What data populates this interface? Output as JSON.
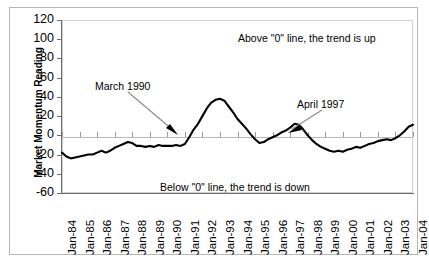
{
  "chart_data": {
    "type": "line",
    "title": "",
    "xlabel": "",
    "ylabel": "Market Momentum Reading",
    "ylim": [
      -60,
      120
    ],
    "yticks": [
      120,
      100,
      80,
      60,
      40,
      20,
      0,
      -20,
      -40,
      -60
    ],
    "grid": false,
    "legend": null,
    "categories": [
      "Jan-84",
      "Jan-85",
      "Jan-86",
      "Jan-87",
      "Jan-88",
      "Jan-89",
      "Jan-90",
      "Jan-91",
      "Jan-92",
      "Jan-93",
      "Jan-94",
      "Jan-95",
      "Jan-96",
      "Jan-97",
      "Jan-98",
      "Jan-99",
      "Jan-00",
      "Jan-01",
      "Jan-02",
      "Jan-03",
      "Jan-04"
    ],
    "series": [
      {
        "name": "Market Momentum Reading",
        "color": "#000000",
        "x": [
          1984.0,
          1984.25,
          1984.5,
          1984.75,
          1985.0,
          1985.25,
          1985.5,
          1985.75,
          1986.0,
          1986.25,
          1986.5,
          1986.75,
          1987.0,
          1987.25,
          1987.5,
          1987.75,
          1988.0,
          1988.25,
          1988.5,
          1988.75,
          1989.0,
          1989.25,
          1989.5,
          1989.75,
          1990.0,
          1990.25,
          1990.5,
          1990.75,
          1991.0,
          1991.25,
          1991.5,
          1991.75,
          1992.0,
          1992.25,
          1992.5,
          1992.75,
          1993.0,
          1993.25,
          1993.5,
          1993.75,
          1994.0,
          1994.25,
          1994.5,
          1994.75,
          1995.0,
          1995.25,
          1995.5,
          1995.75,
          1996.0,
          1996.25,
          1996.5,
          1996.75,
          1997.0,
          1997.25,
          1997.5,
          1997.75,
          1998.0,
          1998.25,
          1998.5,
          1998.75,
          1999.0,
          1999.25,
          1999.5,
          1999.75,
          2000.0,
          2000.25,
          2000.5,
          2000.75,
          2001.0,
          2001.25,
          2001.5,
          2001.75,
          2002.0,
          2002.25,
          2002.5,
          2002.75,
          2003.0,
          2003.25,
          2003.5,
          2003.75,
          2004.0
        ],
        "values": [
          -18,
          -22,
          -24,
          -23,
          -22,
          -21,
          -20,
          -20,
          -18,
          -16,
          -18,
          -16,
          -13,
          -11,
          -9,
          -7,
          -8,
          -11,
          -11,
          -12,
          -11,
          -12,
          -10,
          -11,
          -11,
          -11,
          -10,
          -11,
          -9,
          -2,
          6,
          12,
          20,
          28,
          34,
          37,
          38,
          36,
          30,
          24,
          17,
          12,
          7,
          1,
          -4,
          -8,
          -7,
          -4,
          -2,
          0,
          3,
          5,
          8,
          12,
          11,
          6,
          0,
          -5,
          -9,
          -12,
          -14,
          -16,
          -17,
          -16,
          -17,
          -15,
          -14,
          -12,
          -13,
          -11,
          -9,
          -8,
          -6,
          -5,
          -4,
          -5,
          -3,
          0,
          4,
          9,
          11
        ]
      }
    ],
    "annotations": [
      {
        "id": "above-zero",
        "text": "Above \"0\" line, the trend is up"
      },
      {
        "id": "below-zero",
        "text": "Below \"0\" line, the trend is down"
      },
      {
        "id": "march-1990",
        "text": "March 1990",
        "point_x": 1990.08,
        "point_y": 0,
        "note": "arrow points to curve crossing zero going up"
      },
      {
        "id": "april-1997",
        "text": "April 1997",
        "point_x": 1997.3,
        "point_y": 0,
        "note": "arrow points to curve crossing zero going up"
      }
    ]
  },
  "chart_peaks": {
    "peak_1992_value": 38,
    "trough_1985_value": -24,
    "trough_1999_value": -17,
    "peak_2002_value": 22
  }
}
